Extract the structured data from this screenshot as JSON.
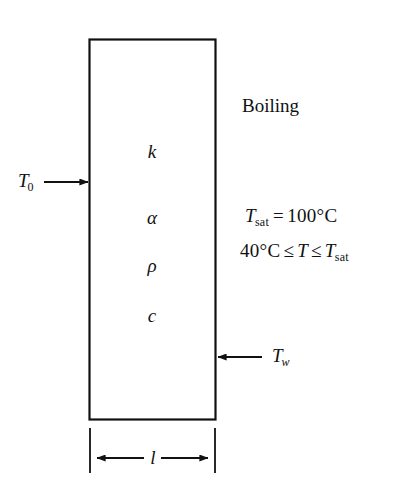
{
  "figure": {
    "background_color": "#ffffff",
    "line_color": "#111111",
    "slab": {
      "label": "slab",
      "fill": "#ffffff",
      "stroke": "#111111"
    },
    "properties": [
      {
        "symbol": "k",
        "name": "thermal-conductivity"
      },
      {
        "symbol": "α",
        "name": "thermal-diffusivity"
      },
      {
        "symbol": "ρ",
        "name": "density"
      },
      {
        "symbol": "c",
        "name": "specific-heat"
      }
    ],
    "left_boundary": {
      "symbol": "T",
      "subscript": "0",
      "arrow_direction": "right"
    },
    "right_boundary": {
      "symbol": "T",
      "subscript": "w",
      "arrow_direction": "left"
    },
    "boiling_label": "Boiling",
    "equations": [
      {
        "name": "saturation-temperature",
        "lhs_symbol": "T",
        "lhs_subscript": "sat",
        "operator": "=",
        "rhs": "100°C",
        "full_text": "T_sat = 100°C"
      },
      {
        "name": "temperature-range",
        "lower_bound": "40°C",
        "operator_left": "≤",
        "variable": "T",
        "operator_right": "≤",
        "upper_symbol": "T",
        "upper_subscript": "sat",
        "full_text": "40°C ≤ T ≤ T_sat"
      }
    ],
    "dimension": {
      "symbol": "l",
      "name": "slab-thickness",
      "style": "double-headed-arrow"
    }
  }
}
